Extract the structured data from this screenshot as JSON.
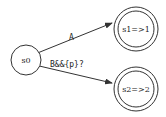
{
  "diagram": {
    "type": "state-machine",
    "colors": {
      "stroke": "#333333",
      "text": "#222222",
      "background": "#ffffff"
    },
    "nodes": [
      {
        "id": "s0",
        "label": "s0",
        "accepting": false
      },
      {
        "id": "s1",
        "label": "s1=>1",
        "accepting": true
      },
      {
        "id": "s2",
        "label": "s2=>2",
        "accepting": true
      }
    ],
    "edges": [
      {
        "from": "s0",
        "to": "s1",
        "label": "A"
      },
      {
        "from": "s0",
        "to": "s2",
        "label": "B&&{p}?"
      }
    ]
  }
}
